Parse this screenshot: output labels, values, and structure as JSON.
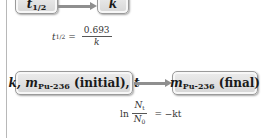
{
  "diagram": {
    "row1": {
      "from_box": {
        "var": "t",
        "sub": "1/2"
      },
      "to_box": {
        "var": "k"
      },
      "equation": {
        "lhs_var": "t",
        "lhs_sub": "1/2",
        "equals": "=",
        "numerator": "0.693",
        "denominator": "k"
      }
    },
    "row2": {
      "from_box": {
        "k": "k,",
        "m": "m",
        "m_sub": "Pu-236",
        "initial": "(initial),",
        "t": "t"
      },
      "to_box": {
        "m": "m",
        "m_sub": "Pu-236",
        "final": "(final)"
      },
      "equation": {
        "ln": "ln",
        "numerator_var": "N",
        "numerator_sub": "t",
        "denominator_var": "N",
        "denominator_sub": "0",
        "rhs": "= −kt"
      }
    },
    "colors": {
      "box_fill": "#e0e0e0",
      "box_border": "#9a9a9a",
      "arrow": "#8f8f8f"
    }
  }
}
